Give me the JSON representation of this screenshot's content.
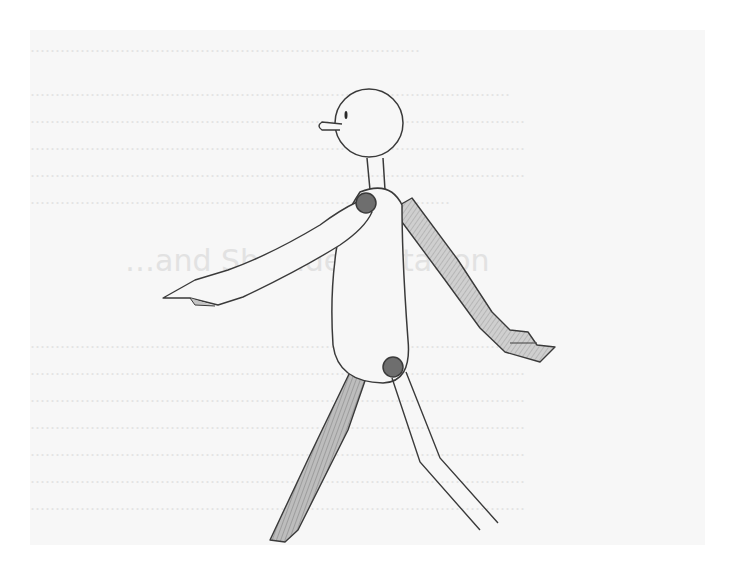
{
  "illustration": {
    "subject": "pencil-sketch-walking-figure",
    "description": "Pencil drawing of a simple mannequin-like figure walking, arms swinging, over faded printed page text",
    "colors": {
      "paper": "#f7f7f7",
      "outline": "#3a3a3a",
      "shading": "#b5b5b5",
      "joint": "#6e6e6e",
      "ghost_text": "#e3e3e3"
    }
  },
  "background_page": {
    "heading": "…and Shoulder Rotation",
    "paragraph_lines_top": [
      "……………………………………………………………………",
      "……………………………………………………………………………………",
      "………………………………………………………………………………………",
      "………………………………………………………………………………………",
      "………………………………………………………………………………………",
      "…………………………………………………………………………"
    ],
    "paragraph_lines_bottom": [
      "………………………………………………………………………………………",
      "………………………………………………………………………………………",
      "………………………………………………………………………………………",
      "………………………………………………………………………………………",
      "………………………………………………………………………………………",
      "………………………………………………………………………………………",
      "………………………………………………………………………………………"
    ]
  }
}
